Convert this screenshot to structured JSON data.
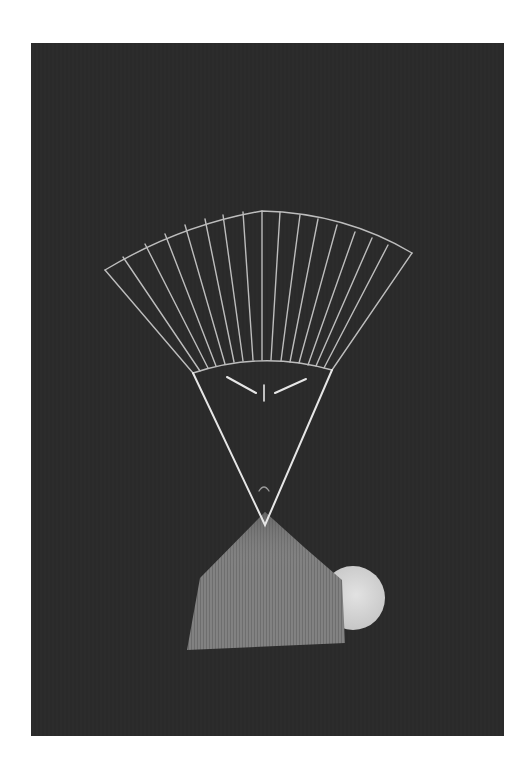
{
  "artwork": {
    "description": "Drawing on black paper: a folded fan above a triangular face, a hatched pentagonal body, and a pale moon",
    "colors": {
      "page_background": "#ffffff",
      "paper": "#2a2a2a",
      "line": "#bdbdbd",
      "face_line": "#e6e6e6",
      "body_fill": "#7a7a7a",
      "moon_fill": "#d8d8d8"
    },
    "fan": {
      "rib_count": 17
    },
    "elements": [
      "fan-headdress",
      "triangular-face",
      "eyes",
      "nose",
      "mouth",
      "hatched-body",
      "moon"
    ]
  }
}
